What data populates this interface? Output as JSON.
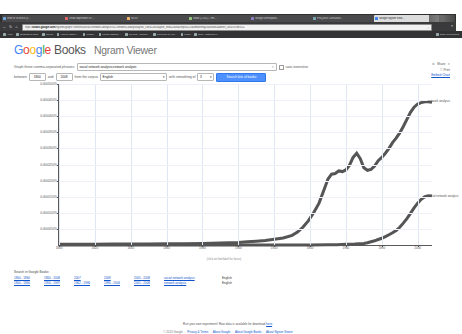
{
  "browser": {
    "tabs": [
      {
        "label": "Web of Science (v..."
      },
      {
        "label": "Show dependent of ..."
      },
      {
        "label": "NIJS?"
      },
      {
        "label": "Inbox (1,501) - em..."
      },
      {
        "label": "Google anthropolo..."
      },
      {
        "label": "ProQuest Consultan..."
      },
      {
        "label": "Google Ngram View...",
        "active": true
      }
    ],
    "nav": {
      "back": "←",
      "forward": "→",
      "reload": "↻",
      "home": "⌂",
      "menu": "≡"
    },
    "url_prefix": "https://",
    "url_domain": "books.google.com",
    "url_path": "/ngrams/graph?content=social+network+analysis%2Cnetwork+analysis&year_start=1800&year_end=2008&corpus=15&smoothing=3&share=&direct_url=t1%3B%2C",
    "star_icon": "☆",
    "bookmarks": [
      {
        "label": "Apps"
      },
      {
        "label": "Suggested Sites"
      },
      {
        "label": "iCloud"
      },
      {
        "label": "How to install i..."
      },
      {
        "label": "WINDY"
      },
      {
        "label": "Illinois Institute ..."
      },
      {
        "label": "LS Test - Tutoria..."
      },
      {
        "label": "Welcome to you..."
      },
      {
        "label": "Maps"
      },
      {
        "label": "NPR : National P..."
      }
    ],
    "other_bookmarks": "Other bookmarks"
  },
  "header": {
    "logo_letters": [
      "G",
      "o",
      "o",
      "g",
      "l",
      "e"
    ],
    "books": "Books",
    "product": "Ngram Viewer"
  },
  "form": {
    "phrase_label": "Graph these comma-separated phrases:",
    "phrase_value": "social network analysis,network analysis",
    "case_insensitive_label": "case-insensitive",
    "between_label": "between",
    "year_start": "1800",
    "and_label": "and",
    "year_end": "2008",
    "corpus_label": "from the corpus",
    "corpus_value": "English",
    "smoothing_label": "with smoothing of",
    "smoothing_value": "3",
    "search_button": "Search lots of books",
    "caret": "▾"
  },
  "rail": {
    "share_label": "Share",
    "print_label": "Print",
    "embed_label": "Embed Chart"
  },
  "chart_data": {
    "type": "line",
    "title": "",
    "xlabel": "",
    "ylabel": "",
    "note": "(click on line/label for focus)",
    "xlim": [
      1800,
      2008
    ],
    "ylim": [
      0,
      5e-05
    ],
    "xticks": [
      1800,
      1820,
      1840,
      1860,
      1880,
      1900,
      1920,
      1940,
      1960,
      1980,
      2000
    ],
    "xtick_labels": [
      "1800",
      "1820",
      "1840",
      "1860",
      "1880",
      "1900",
      "1920",
      "1940",
      "1960",
      "1980",
      "2000"
    ],
    "yticks": [
      5e-06,
      1e-05,
      1.5e-05,
      2e-05,
      2.5e-05,
      3e-05,
      3.5e-05,
      4e-05,
      4.5e-05,
      5e-05
    ],
    "ytick_labels": [
      "0.0000050%",
      "0.0000100%",
      "0.0000150%",
      "0.0000200%",
      "0.0000250%",
      "0.0000300%",
      "0.0000350%",
      "0.0000400%",
      "0.0000450%",
      "0.0000500%"
    ],
    "grid": true,
    "legend_position": "inline-right",
    "series": [
      {
        "name": "network analysis",
        "color": "#555555",
        "label_x": 2004,
        "label_y": 4.45e-05,
        "x": [
          1800,
          1810,
          1820,
          1830,
          1840,
          1850,
          1860,
          1870,
          1880,
          1890,
          1900,
          1905,
          1910,
          1915,
          1920,
          1925,
          1930,
          1933,
          1936,
          1939,
          1942,
          1945,
          1948,
          1950,
          1952,
          1954,
          1956,
          1958,
          1960,
          1962,
          1964,
          1966,
          1968,
          1970,
          1972,
          1974,
          1976,
          1978,
          1980,
          1982,
          1984,
          1986,
          1988,
          1990,
          1992,
          1994,
          1996,
          1998,
          2000,
          2002,
          2004,
          2006,
          2008
        ],
        "y": [
          2e-07,
          2e-07,
          2e-07,
          3e-07,
          3e-07,
          3e-07,
          4e-07,
          4e-07,
          5e-07,
          6e-07,
          8e-07,
          1e-06,
          1.2e-06,
          1.4e-06,
          1.8e-06,
          2.2e-06,
          3e-06,
          4e-06,
          5.5e-06,
          7.5e-06,
          1e-05,
          1.3e-05,
          1.75e-05,
          2.05e-05,
          2.2e-05,
          2.22e-05,
          2.3e-05,
          2.28e-05,
          2.33e-05,
          2.48e-05,
          2.72e-05,
          2.85e-05,
          2.68e-05,
          2.4e-05,
          2.32e-05,
          2.35e-05,
          2.45e-05,
          2.62e-05,
          2.72e-05,
          2.85e-05,
          3e-05,
          3.18e-05,
          3.32e-05,
          3.48e-05,
          3.68e-05,
          3.9e-05,
          4.12e-05,
          4.28e-05,
          4.38e-05,
          4.42e-05,
          4.45e-05,
          4.45e-05,
          4.43e-05
        ]
      },
      {
        "name": "social network analysis",
        "color": "#555555",
        "label_x": 2004,
        "label_y": 1.5e-05,
        "x": [
          1800,
          1850,
          1900,
          1920,
          1940,
          1950,
          1955,
          1960,
          1965,
          1970,
          1972,
          1974,
          1976,
          1978,
          1980,
          1982,
          1984,
          1986,
          1988,
          1990,
          1992,
          1994,
          1996,
          1998,
          2000,
          2002,
          2004,
          2006,
          2008
        ],
        "y": [
          0.0,
          0.0,
          0.0,
          0.0,
          0.0,
          1e-07,
          1e-07,
          2e-07,
          3e-07,
          5e-07,
          7e-07,
          1e-06,
          1.3e-06,
          1.7e-06,
          2.1e-06,
          2.6e-06,
          3.2e-06,
          3.8e-06,
          4.5e-06,
          5.5e-06,
          6.8e-06,
          8.2e-06,
          9.8e-06,
          1.15e-05,
          1.3e-05,
          1.42e-05,
          1.5e-05,
          1.53e-05,
          1.52e-05
        ]
      }
    ]
  },
  "search_table": {
    "title": "Search in Google Books:",
    "rows": [
      {
        "ranges": [
          "1800 - 1860",
          "1860 - 2008",
          "2007",
          "2008",
          "2005 - 2008"
        ],
        "query": "social network analysis",
        "corpus": "English"
      },
      {
        "ranges": [
          "1800 - 1860",
          "1956 - 1997",
          "1962 - 1996",
          "1996 - 2004",
          "2005 - 2008"
        ],
        "query": "network analysis",
        "corpus": "English"
      }
    ]
  },
  "footer": {
    "line1_pre": "Run your own experiment! Raw data is available for download ",
    "line1_link": "here",
    "line1_post": ".",
    "copyright": "© 2013 Google",
    "links": [
      "Privacy & Terms",
      "About Google",
      "About Google Books",
      "About Ngram Viewer"
    ]
  }
}
